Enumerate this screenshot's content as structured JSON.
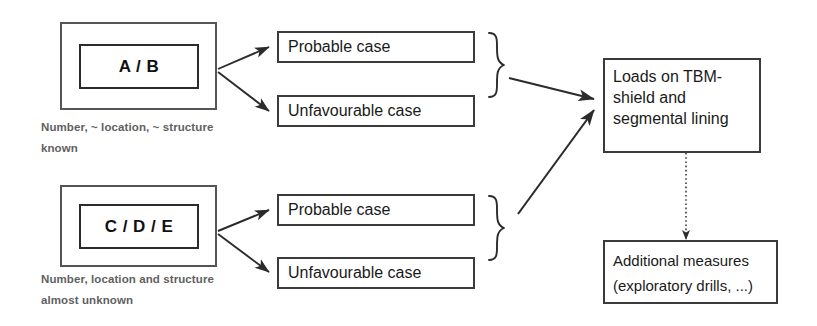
{
  "diagram": {
    "background_color": "#ffffff",
    "line_color": "#333333",
    "caption_color": "#5f5f5f"
  },
  "groups": [
    {
      "id": "group-ab",
      "class_label": "A / B",
      "caption_line1": "Number, ~ location, ~ structure",
      "caption_line2": "known",
      "cases": [
        {
          "label": "Probable case"
        },
        {
          "label": "Unfavourable case"
        }
      ]
    },
    {
      "id": "group-cde",
      "class_label": "C / D / E",
      "caption_line1": "Number, location and structure",
      "caption_line2": "almost unknown",
      "cases": [
        {
          "label": "Probable case"
        },
        {
          "label": "Unfavourable case"
        }
      ]
    }
  ],
  "outputs": {
    "loads": {
      "line1": "Loads on TBM-",
      "line2": "shield and",
      "line3": "segmental lining"
    },
    "measures": {
      "line1": "Additional measures",
      "line2": "(exploratory drills, ...)"
    }
  }
}
